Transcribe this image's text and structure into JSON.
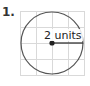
{
  "problem": {
    "number": "1.",
    "label": "2 units"
  },
  "figure": {
    "grid": {
      "x0": 20,
      "y0": 11,
      "cell": 16,
      "cols": 4,
      "rows": 4,
      "color": "#d9d9d9"
    },
    "circle": {
      "cx": 52,
      "cy": 43,
      "r": 31,
      "stroke": "#555555"
    },
    "radius_line": {
      "x1": 52,
      "y1": 43,
      "x2": 83,
      "y2": 43
    },
    "center_dot_color": "#222222"
  }
}
